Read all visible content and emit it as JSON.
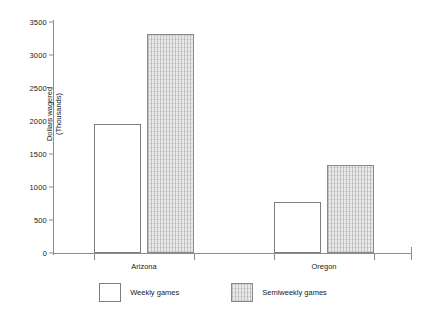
{
  "chart_data": {
    "type": "bar",
    "title": "",
    "xlabel": "",
    "ylabel": "Dollars wagered (Thousands)",
    "ylabel_lines": [
      "Dollars wagered",
      "(Thousands)"
    ],
    "categories": [
      "Arizona",
      "Oregon"
    ],
    "series": [
      {
        "name": "Weekly games",
        "values": [
          1950,
          770
        ],
        "fill": "#ffffff"
      },
      {
        "name": "Semiweekly games",
        "values": [
          3320,
          1330
        ],
        "fill": "#e9e9e9"
      }
    ],
    "ylim": [
      0,
      3500
    ],
    "yticks": [
      0,
      500,
      1000,
      1500,
      2000,
      2500,
      3000,
      3500
    ],
    "ytick_labels": [
      "0",
      "500",
      "1000",
      "1500",
      "2000",
      "2500",
      "3000",
      "3500"
    ],
    "grid": false,
    "legend_position": "bottom",
    "axis_color": "#8c8c8c",
    "bar_border_color": "#7d7d7d"
  }
}
